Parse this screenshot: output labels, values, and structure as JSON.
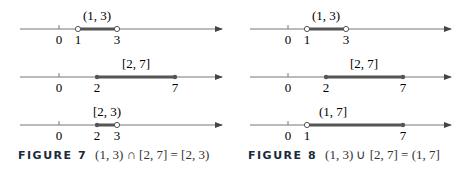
{
  "panels": [
    {
      "figure_label": "FIGURE 7",
      "caption_expr": "(1, 3) ∩ [2, 7] = [2, 3)",
      "lines": [
        {
          "label": "(1, 3)",
          "ticks": [
            "0",
            "1",
            "3"
          ]
        },
        {
          "label": "[2, 7]",
          "ticks": [
            "0",
            "2",
            "7"
          ]
        },
        {
          "label": "[2, 3)",
          "ticks": [
            "0",
            "2",
            "3"
          ]
        }
      ]
    },
    {
      "figure_label": "FIGURE 8",
      "caption_expr": "(1, 3) ∪ [2, 7] = (1, 7]",
      "lines": [
        {
          "label": "(1, 3)",
          "ticks": [
            "0",
            "1",
            "3"
          ]
        },
        {
          "label": "[2, 7]",
          "ticks": [
            "0",
            "2",
            "7"
          ]
        },
        {
          "label": "(1, 7]",
          "ticks": [
            "0",
            "1",
            "7"
          ]
        }
      ]
    }
  ],
  "colors": {
    "axis": "#555555",
    "interval": "#555555",
    "caption_label": "#1a2a3a"
  }
}
